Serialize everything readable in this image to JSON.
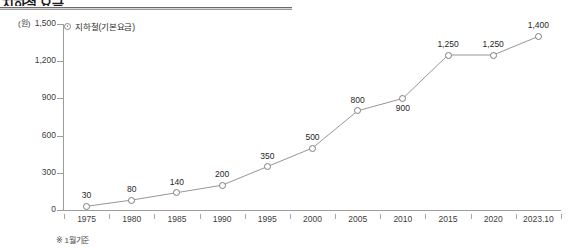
{
  "header": {
    "title": "지하철 요금",
    "rule": true
  },
  "legend": {
    "label": "지하철(기본요금)",
    "marker": "circle-marker-icon"
  },
  "footnote": "※ 1월기준",
  "axis": {
    "y_unit": "(원)",
    "y_ticks": [
      "1,500",
      "1,200",
      "900",
      "600",
      "300",
      "0"
    ],
    "x_ticks": [
      "1975",
      "1980",
      "1985",
      "1990",
      "1995",
      "2000",
      "2005",
      "2010",
      "2015",
      "2020",
      "2023.10"
    ]
  },
  "chart_data": {
    "type": "line",
    "title": "지하철 요금",
    "xlabel": "",
    "ylabel": "(원)",
    "ylim": [
      0,
      1500
    ],
    "yticks": [
      0,
      300,
      600,
      900,
      1200,
      1500
    ],
    "grid": false,
    "legend_position": "top-left",
    "categories": [
      "1975",
      "1980",
      "1985",
      "1990",
      "1995",
      "2000",
      "2005",
      "2010",
      "2015",
      "2020",
      "2023.10"
    ],
    "series": [
      {
        "name": "지하철(기본요금)",
        "values": [
          30,
          80,
          140,
          200,
          350,
          500,
          800,
          900,
          1250,
          1250,
          1400
        ],
        "labels": [
          "30",
          "80",
          "140",
          "200",
          "350",
          "500",
          "800",
          "900",
          "1,250",
          "1,250",
          "1,400"
        ],
        "label_positions": [
          "above",
          "above",
          "above",
          "above",
          "above",
          "above",
          "above",
          "below",
          "above",
          "above",
          "above"
        ],
        "color": "#8a8a8a",
        "marker": "open-circle"
      }
    ],
    "annotations": [
      "※ 1월기준"
    ]
  }
}
